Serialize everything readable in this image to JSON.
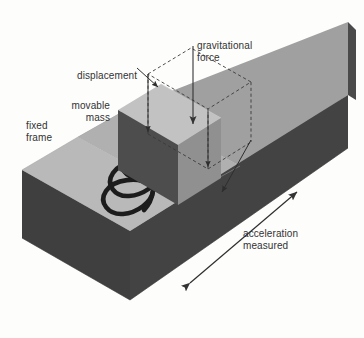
{
  "diagram": {
    "type": "technical-illustration",
    "background_color": "#fdfdfc",
    "labels": [
      {
        "id": "gravitational-force",
        "text": "gravitational\nforce",
        "x": 197,
        "y": 40,
        "align": "left"
      },
      {
        "id": "displacement",
        "text": "displacement",
        "x": 77,
        "y": 70,
        "align": "left"
      },
      {
        "id": "movable-mass",
        "text": "movable\nmass",
        "x": 67,
        "y": 100,
        "align": "right"
      },
      {
        "id": "fixed-frame",
        "text": "fixed\nframe",
        "x": 26,
        "y": 120,
        "align": "left"
      },
      {
        "id": "acceleration-measured",
        "text": "acceleration\nmeasured",
        "x": 243,
        "y": 228,
        "align": "left"
      }
    ],
    "colors": {
      "top_light": "#b9b9b9",
      "top_light_2": "#b0b0b0",
      "side_medium": "#9c9c9c",
      "side_medium_2": "#939393",
      "front_dark": "#3f3f3f",
      "front_dark_2": "#4a4a4a",
      "mass_top": "#c2c2c2",
      "mass_left": "#4d4d4d",
      "mass_right": "#8f8f8f",
      "spring": "#1c1c1c",
      "arrow": "#333333",
      "dashed": "#3a3a3a",
      "text": "#333333"
    },
    "parts": [
      {
        "name": "fixed-frame",
        "description": "L-shaped isometric base block"
      },
      {
        "name": "movable-mass",
        "description": "rectangular block inside frame slot"
      },
      {
        "name": "spring",
        "description": "helical coil spring, 3 turns"
      },
      {
        "name": "dashed-outline",
        "description": "undisplaced mass position"
      }
    ],
    "arrows": [
      {
        "name": "gravitational-force-arrow",
        "style": "single-head",
        "direction": "down"
      },
      {
        "name": "displacement-arrow-left",
        "style": "single-head",
        "direction": "down-left"
      },
      {
        "name": "displacement-arrow-mid",
        "style": "single-head",
        "direction": "down-left"
      },
      {
        "name": "displacement-arrow-right",
        "style": "single-head",
        "direction": "down-left"
      },
      {
        "name": "acceleration-arrow",
        "style": "double-head",
        "direction": "diagonal"
      }
    ]
  }
}
